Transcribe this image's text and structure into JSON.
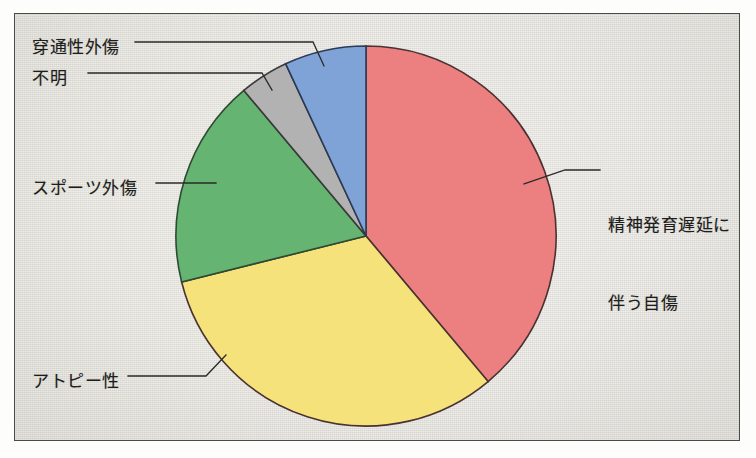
{
  "figure": {
    "background_color": "#e8e6e0",
    "border_color": "#4a4a46",
    "text_color": "#1d1d1b"
  },
  "chart_data": {
    "type": "pie",
    "title": "",
    "xlabel": "",
    "ylabel": "",
    "legend_position": "callout-labels",
    "grid": false,
    "start_angle_deg": 0,
    "direction": "clockwise",
    "categories": [
      "精神発育遅延に伴う自傷",
      "アトピー性",
      "スポーツ外傷",
      "不明",
      "穿通性外傷"
    ],
    "values": [
      38.9,
      32.2,
      17.8,
      4.2,
      6.9
    ],
    "colors": [
      "#ec8081",
      "#f6e27a",
      "#65b471",
      "#b2b2b2",
      "#7fa3d6"
    ],
    "slices": [
      {
        "label": "精神発育遅延に伴う自傷",
        "value": 38.9,
        "color": "#ec8081",
        "start_deg": 0,
        "end_deg": 140
      },
      {
        "label": "アトピー性",
        "value": 32.2,
        "color": "#f6e27a",
        "start_deg": 140,
        "end_deg": 256
      },
      {
        "label": "スポーツ外傷",
        "value": 17.8,
        "color": "#65b471",
        "start_deg": 256,
        "end_deg": 320
      },
      {
        "label": "不明",
        "value": 4.2,
        "color": "#b2b2b2",
        "start_deg": 320,
        "end_deg": 335
      },
      {
        "label": "穿通性外傷",
        "value": 6.9,
        "color": "#7fa3d6",
        "start_deg": 335,
        "end_deg": 360
      }
    ]
  },
  "labels": {
    "penetrating_trauma": "穿通性外傷",
    "unknown": "不明",
    "sports_injury": "スポーツ外傷",
    "atopic": "アトピー性",
    "self_injury_line1": "精神発育遅延に",
    "self_injury_line2": "伴う自傷"
  }
}
